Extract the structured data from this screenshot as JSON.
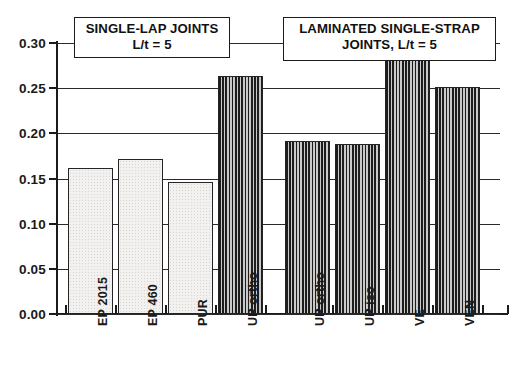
{
  "chart_data": {
    "type": "bar",
    "title": "",
    "subtitle": "",
    "xlabel": "",
    "ylabel": "",
    "ylim": [
      0.0,
      0.3
    ],
    "ytick_values": [
      0.3,
      0.25,
      0.2,
      0.15,
      0.1,
      0.05,
      0.0
    ],
    "ytick_labels": [
      "0.30",
      "0.25",
      "0.20",
      "0.15",
      "0.10",
      "0.05",
      "0.00"
    ],
    "grid": true,
    "grid_axis": "y",
    "legend": false,
    "legend_position": "none",
    "categories": [
      "EP 2015",
      "EP 460",
      "PUR",
      "UP ortho",
      "UP ortho",
      "UP iso",
      "VE",
      "VEN"
    ],
    "values": [
      0.162,
      0.172,
      0.146,
      0.263,
      0.192,
      0.188,
      0.285,
      0.251
    ],
    "bar_styles": [
      "stippled-light",
      "stippled-light",
      "stippled-light",
      "vertical-hatch-dark",
      "vertical-hatch-dark",
      "vertical-hatch-dark",
      "vertical-hatch-dark",
      "vertical-hatch-dark"
    ],
    "groups": [
      {
        "name": "SINGLE-LAP JOINTS",
        "condition": "L/t = 5",
        "categories": [
          "EP 2015",
          "EP 460",
          "PUR",
          "UP ortho"
        ],
        "values": [
          0.162,
          0.172,
          0.146,
          0.263
        ]
      },
      {
        "name": "LAMINATED SINGLE-STRAP JOINTS",
        "condition": "L/t = 5",
        "categories": [
          "UP ortho",
          "UP iso",
          "VE",
          "VEN"
        ],
        "values": [
          0.192,
          0.188,
          0.285,
          0.251
        ]
      }
    ],
    "annotations": [
      {
        "id": "left-box",
        "line1": "SINGLE-LAP JOINTS",
        "line2": "L/t  =  5"
      },
      {
        "id": "right-box",
        "line1": "LAMINATED SINGLE-STRAP",
        "line2": "JOINTS, L/t  =  5"
      }
    ]
  },
  "axis": {
    "y_ticks": [
      {
        "label": "0.30",
        "value": 0.3
      },
      {
        "label": "0.25",
        "value": 0.25
      },
      {
        "label": "0.20",
        "value": 0.2
      },
      {
        "label": "0.15",
        "value": 0.15
      },
      {
        "label": "0.10",
        "value": 0.1
      },
      {
        "label": "0.05",
        "value": 0.05
      },
      {
        "label": "0.00",
        "value": 0.0
      }
    ]
  },
  "bars": [
    {
      "label": "EP 2015",
      "value": 0.162,
      "style": "light"
    },
    {
      "label": "EP 460",
      "value": 0.172,
      "style": "light"
    },
    {
      "label": "PUR",
      "value": 0.146,
      "style": "light"
    },
    {
      "label": "UP ortho",
      "value": 0.263,
      "style": "hatch"
    },
    {
      "label": "UP ortho",
      "value": 0.192,
      "style": "hatch"
    },
    {
      "label": "UP iso",
      "value": 0.188,
      "style": "hatch"
    },
    {
      "label": "VE",
      "value": 0.285,
      "style": "hatch"
    },
    {
      "label": "VEN",
      "value": 0.251,
      "style": "hatch"
    }
  ],
  "caption": {
    "text": ""
  }
}
